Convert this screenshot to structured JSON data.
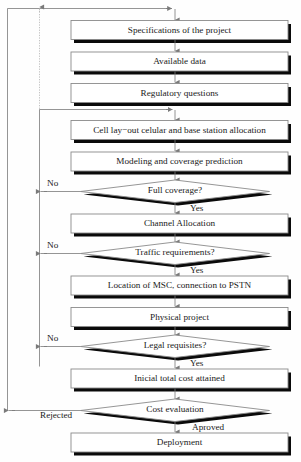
{
  "diagram": {
    "type": "flowchart",
    "nodes": [
      {
        "id": "specifications",
        "shape": "process",
        "label": "Specifications of the project"
      },
      {
        "id": "available_data",
        "shape": "process",
        "label": "Available data"
      },
      {
        "id": "regulatory",
        "shape": "process",
        "label": "Regulatory questions"
      },
      {
        "id": "cell_layout",
        "shape": "process",
        "label": "Cell lay−out celular and base station allocation"
      },
      {
        "id": "modeling",
        "shape": "process",
        "label": "Modeling and coverage prediction"
      },
      {
        "id": "full_coverage",
        "shape": "decision",
        "label": "Full coverage?"
      },
      {
        "id": "channel_allocation",
        "shape": "process",
        "label": "Channel Allocation"
      },
      {
        "id": "traffic_req",
        "shape": "decision",
        "label": "Traffic requirements?"
      },
      {
        "id": "msc_location",
        "shape": "process",
        "label": "Location of MSC, connection to PSTN"
      },
      {
        "id": "physical_project",
        "shape": "process",
        "label": "Physical project"
      },
      {
        "id": "legal_requisites",
        "shape": "decision",
        "label": "Legal requisites?"
      },
      {
        "id": "initial_cost",
        "shape": "process",
        "label": "Inicial total cost attained"
      },
      {
        "id": "cost_evaluation",
        "shape": "decision",
        "label": "Cost evaluation"
      },
      {
        "id": "deployment",
        "shape": "process",
        "label": "Deployment"
      }
    ],
    "edge_labels": {
      "full_coverage_no": "No",
      "full_coverage_yes": "Yes",
      "traffic_no": "No",
      "traffic_yes": "Yes",
      "legal_no": "No",
      "legal_yes": "Yes",
      "cost_rejected": "Rejected",
      "cost_approved": "Aproved"
    },
    "colors": {
      "node_fill": "#ffffff",
      "node_stroke": "#8a8a8a",
      "shadow": "#0a0a0a",
      "connector": "#7a7a7a",
      "text": "#1a1a1a",
      "background": "#fefefe"
    }
  }
}
